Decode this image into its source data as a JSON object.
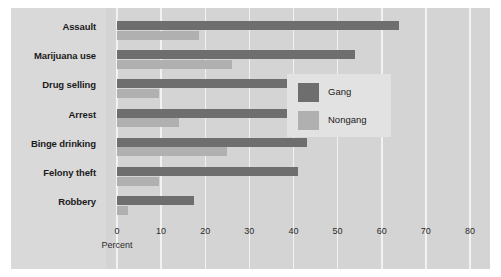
{
  "chart_data": {
    "type": "bar",
    "orientation": "horizontal",
    "title": "",
    "xlabel": "Percent",
    "ylabel": "",
    "xlim": [
      0,
      80
    ],
    "xticks": [
      0,
      10,
      20,
      30,
      40,
      50,
      60,
      70,
      80
    ],
    "xtick_labels": [
      "0",
      "10",
      "20",
      "30",
      "40",
      "50",
      "60",
      "70",
      "80"
    ],
    "grid": "vertical",
    "legend_position": "center-right",
    "categories": [
      "Assault",
      "Marijuana use",
      "Drug selling",
      "Arrest",
      "Binge drinking",
      "Felony theft",
      "Robbery"
    ],
    "series": [
      {
        "name": "Gang",
        "color": "#6e6e6e",
        "values": [
          64,
          54,
          51,
          51,
          43,
          41,
          17.5
        ]
      },
      {
        "name": "Nongang",
        "color": "#b0b0b0",
        "values": [
          18.5,
          26,
          9.5,
          14,
          25,
          9.5,
          2.5
        ]
      }
    ]
  },
  "legend": {
    "items": [
      {
        "label": "Gang",
        "color": "#6e6e6e"
      },
      {
        "label": "Nongang",
        "color": "#b0b0b0"
      }
    ]
  },
  "colors": {
    "figure_background": "#d4d4d4",
    "label_panel": "#d9d9d9",
    "gridline": "#f2f2f2",
    "legend_background": "#e2e2e2",
    "gang_bar": "#6e6e6e",
    "nongang_bar": "#b0b0b0",
    "text": "#1b1b1b"
  }
}
